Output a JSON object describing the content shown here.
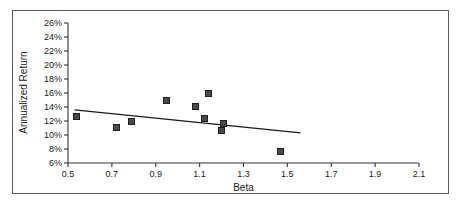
{
  "chart_data": {
    "type": "scatter",
    "title": "",
    "xlabel": "Beta",
    "ylabel": "Annualized Return",
    "xlim": [
      0.5,
      2.1
    ],
    "ylim": [
      6,
      26
    ],
    "xticks": [
      "0.5",
      "0.7",
      "0.9",
      "1.1",
      "1.3",
      "1.5",
      "1.7",
      "1.9",
      "2.1"
    ],
    "xtick_values": [
      0.5,
      0.7,
      0.9,
      1.1,
      1.3,
      1.5,
      1.7,
      1.9,
      2.1
    ],
    "yticks": [
      "6%",
      "8%",
      "10%",
      "12%",
      "14%",
      "16%",
      "18%",
      "20%",
      "22%",
      "24%",
      "26%"
    ],
    "ytick_values": [
      6,
      8,
      10,
      12,
      14,
      16,
      18,
      20,
      22,
      24,
      26
    ],
    "grid": false,
    "legend": false,
    "marker_color": "#4a4a4a",
    "marker_edge_color": "#1f1f1f",
    "axis_color": "#333333",
    "trendline_color": "#1a1a1a",
    "points": [
      {
        "x": 0.54,
        "y": 12.6
      },
      {
        "x": 0.72,
        "y": 11.1
      },
      {
        "x": 0.79,
        "y": 12.0
      },
      {
        "x": 0.95,
        "y": 15.0
      },
      {
        "x": 1.08,
        "y": 14.1
      },
      {
        "x": 1.14,
        "y": 16.0
      },
      {
        "x": 1.12,
        "y": 12.4
      },
      {
        "x": 1.21,
        "y": 11.6
      },
      {
        "x": 1.2,
        "y": 10.6
      },
      {
        "x": 1.47,
        "y": 7.7
      }
    ],
    "trendline": {
      "x_start": 0.53,
      "y_start": 13.6,
      "x_end": 1.56,
      "y_end": 10.3
    }
  }
}
